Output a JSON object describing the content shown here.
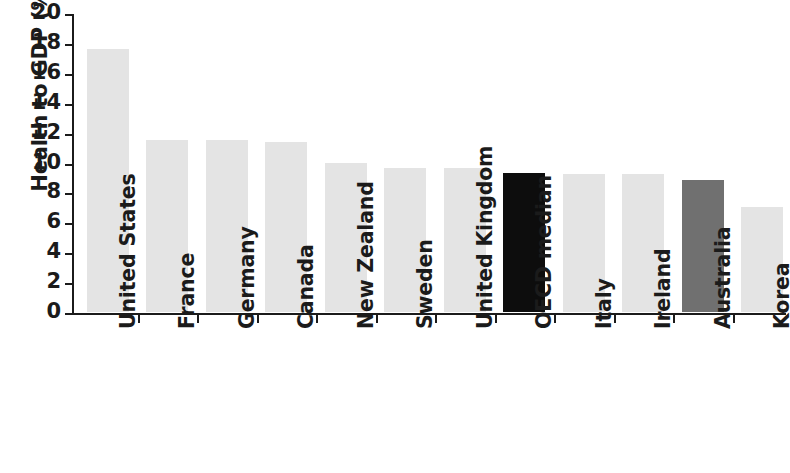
{
  "chart_data": {
    "type": "bar",
    "title": "",
    "xlabel": "",
    "ylabel": "Health to GDP (%)",
    "ylim": [
      0,
      20
    ],
    "ytick_step": 2,
    "yticks": [
      "20",
      "18",
      "16",
      "14",
      "12",
      "10",
      "8",
      "6",
      "4",
      "2",
      "0"
    ],
    "grid": false,
    "legend": "none",
    "categories": [
      "United States",
      "France",
      "Germany",
      "Canada",
      "New Zealand",
      "Sweden",
      "United Kingdom",
      "OECD median",
      "Italy",
      "Ireland",
      "Australia",
      "Korea"
    ],
    "values": [
      17.6,
      11.5,
      11.5,
      11.4,
      10.0,
      9.6,
      9.6,
      9.3,
      9.2,
      9.2,
      8.8,
      7.0
    ],
    "bar_colors": [
      "#e4e4e4",
      "#e4e4e4",
      "#e4e4e4",
      "#e4e4e4",
      "#e4e4e4",
      "#e4e4e4",
      "#e4e4e4",
      "#0d0d0d",
      "#e4e4e4",
      "#e4e4e4",
      "#707070",
      "#e4e4e4"
    ],
    "palette": {
      "default_bar": "#e4e4e4",
      "highlight_median": "#0d0d0d",
      "highlight_australia": "#707070",
      "axis": "#1b1b1b",
      "text": "#1b1b1b",
      "background": "#ffffff"
    }
  }
}
